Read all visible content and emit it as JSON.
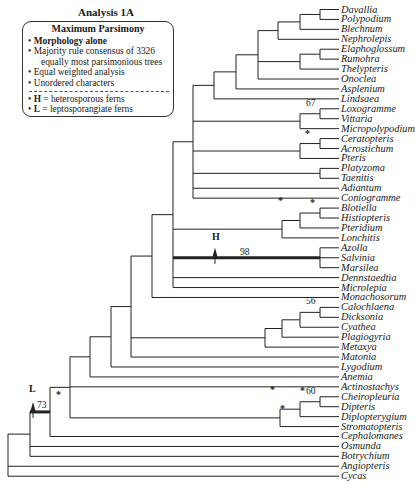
{
  "title": "Analysis 1A",
  "legend": {
    "heading": "Maximum Parsimony",
    "items": [
      "Morphology  alone",
      "Majority rule consensus of 3326",
      "equally most parsimonious trees",
      "Equal weighted analysis",
      "Unordered characters"
    ],
    "keys": [
      {
        "symbol": "H",
        "text": " = heterosporous ferns"
      },
      {
        "symbol": "L",
        "text": " = leptosporangiate ferns"
      }
    ]
  },
  "taxa": [
    "Davallia",
    "Polypodium",
    "Blechnum",
    "Nephrolepis",
    "Elaphoglossum",
    "Rumohra",
    "Thelypteris",
    "Onoclea",
    "Asplenium",
    "Lindsaea",
    "Loxogramme",
    "Vittaria",
    "Micropolypodium",
    "Ceratopteris",
    "Acrostichum",
    "Pteris",
    "Platyzoma",
    "Taenitis",
    "Adiantum",
    "Coniogramme",
    "Blotiella",
    "Histiopteris",
    "Pteridium",
    "Lonchitis",
    "Azolla",
    "Salvinia",
    "Marsilea",
    "Dennstaedtia",
    "Microlepia",
    "Monachosorum",
    "Calochlaena",
    "Dicksonia",
    "Cyathea",
    "Plagiogyria",
    "Metaxya",
    "Matonia",
    "Lygodium",
    "Anemia",
    "Actinostachys",
    "Cheiropleuria",
    "Dipteris",
    "Diplopterygium",
    "Stromatopteris",
    "Cephalomanes",
    "Osmunda",
    "Botrychium",
    "Angiopteris",
    "Cycas"
  ],
  "support": {
    "loxogramme_vittaria": "67",
    "heterosporous": "98",
    "calochlaena_dicksonia": "56",
    "cheiropleuria_dipteris": "60",
    "leptosporangiate": "73",
    "star": "*"
  },
  "markers": {
    "H": "H",
    "L": "L"
  }
}
